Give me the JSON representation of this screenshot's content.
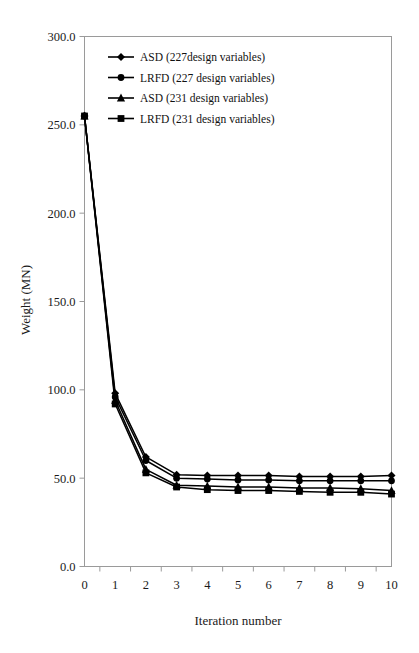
{
  "chart_data": {
    "type": "line",
    "title": "",
    "xlabel": "Iteration number",
    "ylabel": "Weight (MN)",
    "x": [
      0,
      1,
      2,
      3,
      4,
      5,
      6,
      7,
      8,
      9,
      10
    ],
    "xlim": [
      0,
      10
    ],
    "ylim": [
      0,
      300
    ],
    "xticks": [
      "0",
      "1",
      "2",
      "3",
      "4",
      "5",
      "6",
      "7",
      "8",
      "9",
      "10"
    ],
    "yticks": [
      "0.0",
      "50.0",
      "100.0",
      "150.0",
      "200.0",
      "250.0",
      "300.0"
    ],
    "ytick_values": [
      0,
      50,
      100,
      150,
      200,
      250,
      300
    ],
    "grid": false,
    "legend_position": "top-left",
    "series": [
      {
        "name": "ASD (227design variables)",
        "marker": "diamond",
        "values": [
          255.0,
          98.0,
          62.0,
          52.0,
          51.5,
          51.5,
          51.5,
          51.0,
          51.0,
          51.0,
          51.5
        ]
      },
      {
        "name": "LRFD (227 design variables)",
        "marker": "circle",
        "values": [
          255.0,
          96.0,
          60.0,
          50.0,
          49.5,
          49.0,
          49.0,
          48.5,
          48.5,
          48.5,
          48.5
        ]
      },
      {
        "name": "ASD (231 design variables)",
        "marker": "triangle",
        "values": [
          255.0,
          94.0,
          55.0,
          46.0,
          45.5,
          45.0,
          45.0,
          44.5,
          44.5,
          44.0,
          43.0
        ]
      },
      {
        "name": "LRFD (231 design variables)",
        "marker": "square",
        "values": [
          255.0,
          92.0,
          53.0,
          45.0,
          43.5,
          43.0,
          43.0,
          42.5,
          42.0,
          42.0,
          41.0
        ]
      }
    ]
  },
  "legend": {
    "items": [
      {
        "label": "ASD (227design variables)",
        "marker": "diamond"
      },
      {
        "label": "LRFD (227 design variables)",
        "marker": "circle"
      },
      {
        "label": "ASD (231 design variables)",
        "marker": "triangle"
      },
      {
        "label": "LRFD (231 design variables)",
        "marker": "square"
      }
    ]
  },
  "colors": {
    "line": "#000000",
    "marker": "#000000",
    "axis": "#9a9a9a",
    "text": "#111111",
    "background": "#ffffff"
  }
}
